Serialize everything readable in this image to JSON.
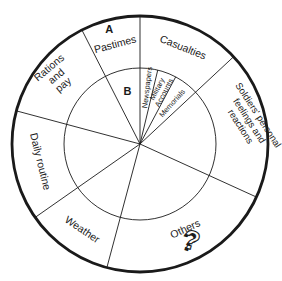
{
  "colors": {
    "background": "#ffffff",
    "line": "#1a1a1a",
    "text": "#1a1a1a"
  },
  "chart_data": {
    "type": "pie",
    "title": "",
    "angle_convention": "degrees clockwise from 12 o'clock",
    "center": {
      "x": 140,
      "y": 144
    },
    "outer_radius": 128,
    "inner_radius": 76,
    "sectors": [
      {
        "label": "Casualties",
        "start_deg": 0,
        "end_deg": 47,
        "label_lines": [
          "Casualties"
        ],
        "label_angle_deg": 24,
        "label_radius": 106,
        "label_rotate_deg": 22,
        "font_size": 10.5,
        "line_height": 11,
        "bold": false
      },
      {
        "label": "Soldiers' personal feelings and reactions",
        "start_deg": 47,
        "end_deg": 114.5,
        "label_lines": [
          "Soldiers' personal",
          "feelings and",
          "reactions"
        ],
        "label_angle_deg": 78,
        "label_radius": 112,
        "label_rotate_deg": 57,
        "font_size": 9.5,
        "line_height": 10.5,
        "bold": false
      },
      {
        "label": "Others",
        "start_deg": 114.5,
        "end_deg": 195,
        "label_lines": [
          "Others"
        ],
        "label_angle_deg": 152,
        "label_radius": 96,
        "label_rotate_deg": -25,
        "font_size": 10.5,
        "line_height": 11,
        "bold": false
      },
      {
        "label": "Weather",
        "start_deg": 195,
        "end_deg": 235,
        "label_lines": [
          "Weather"
        ],
        "label_angle_deg": 214,
        "label_radius": 103,
        "label_rotate_deg": 34,
        "font_size": 10.5,
        "line_height": 11,
        "bold": false
      },
      {
        "label": "Daily routine",
        "start_deg": 235,
        "end_deg": 285,
        "label_lines": [
          "Daily routine"
        ],
        "label_angle_deg": 260,
        "label_radius": 101,
        "label_rotate_deg": 76,
        "font_size": 10.5,
        "line_height": 11,
        "bold": false
      },
      {
        "label": "Rations and pay",
        "start_deg": 285,
        "end_deg": 333,
        "label_lines": [
          "Rations",
          "and",
          "pay"
        ],
        "label_angle_deg": 309,
        "label_radius": 108,
        "label_rotate_deg": -40,
        "font_size": 10.5,
        "line_height": 11,
        "bold": false
      },
      {
        "label": "Pastimes",
        "start_deg": 333,
        "end_deg": 360,
        "label_lines": [
          "Pastimes"
        ],
        "label_angle_deg": 346,
        "label_radius": 103,
        "label_rotate_deg": -15,
        "font_size": 10.5,
        "line_height": 11,
        "bold": false
      }
    ],
    "inner_sectors": [
      {
        "label": "Newspapers",
        "start_deg": 0,
        "end_deg": 13.5,
        "label_lines": [
          "Newspapers"
        ],
        "label_angle_deg": 7,
        "label_radius": 57,
        "label_rotate_deg": -83,
        "font_size": 7.5,
        "line_height": 8,
        "bold": false
      },
      {
        "label": "Military Accounts",
        "start_deg": 13.5,
        "end_deg": 28,
        "label_lines": [
          "Military",
          "Accounts"
        ],
        "label_angle_deg": 21,
        "label_radius": 57,
        "label_rotate_deg": -62,
        "font_size": 7.5,
        "line_height": 8,
        "bold": false
      },
      {
        "label": "Memorials",
        "start_deg": 28,
        "end_deg": 47,
        "label_lines": [
          "Memorials"
        ],
        "label_angle_deg": 38,
        "label_radius": 52,
        "label_rotate_deg": -48,
        "font_size": 7.5,
        "line_height": 8,
        "bold": false
      }
    ],
    "markers": [
      {
        "label": "A",
        "angle_deg": 345,
        "radius": 119,
        "font_size": 11
      },
      {
        "label": "B",
        "angle_deg": 346.5,
        "radius": 54,
        "font_size": 11
      }
    ],
    "icon": {
      "name": "question-mark-icon",
      "glyph": "?",
      "x": 189,
      "y": 249,
      "rotate_deg": 16,
      "font_size": 27
    }
  }
}
